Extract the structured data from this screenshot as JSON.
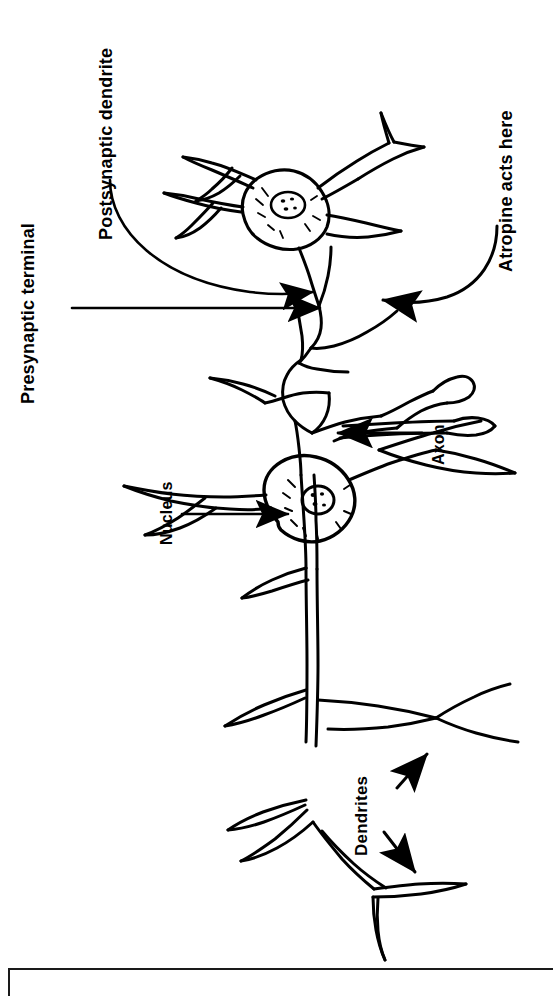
{
  "figure": {
    "orientation": "rotated-90-ccw",
    "background_color": "#ffffff",
    "ink_color": "#000000",
    "labels": {
      "presynaptic_terminal": "Presynaptic  terminal",
      "postsynaptic_dendrite": "Postsynaptic   dendrite",
      "atropine": "Atropine  acts  here",
      "axon": "Axon",
      "nucleus": "Nucleus",
      "dendrites": "Dendrites"
    },
    "caption": {
      "text": ""
    },
    "parts": [
      {
        "name": "upper-neuron-soma",
        "description": "postsynaptic cell body with nucleus and radiating dendrites"
      },
      {
        "name": "upper-neuron-nucleus",
        "description": "small circle containing dots"
      },
      {
        "name": "synaptic-cleft",
        "description": "junction between presynaptic terminal and postsynaptic dendrite"
      },
      {
        "name": "lower-neuron-soma",
        "description": "presynaptic cell body with nucleus and hatched cytoplasm"
      },
      {
        "name": "lower-neuron-nucleus",
        "description": "small circle containing dots"
      },
      {
        "name": "axon",
        "description": "long process running from lower soma toward the synapse"
      },
      {
        "name": "axon-collaterals",
        "description": "two side branches ending in terminal boutons"
      },
      {
        "name": "dendrite-tree",
        "description": "branching dendrites extending from the lower soma"
      }
    ],
    "leaders": [
      {
        "name": "presynaptic-terminal-leader",
        "type": "straight-arrow",
        "points_to": "presynaptic terminal at synapse"
      },
      {
        "name": "postsynaptic-dendrite-leader",
        "type": "curved-arrow",
        "points_to": "postsynaptic dendrite at synapse"
      },
      {
        "name": "atropine-leader",
        "type": "curved-arrow",
        "points_to": "synaptic cleft"
      },
      {
        "name": "axon-leader",
        "type": "straight-arrow",
        "points_to": "axon shaft"
      },
      {
        "name": "nucleus-leader",
        "type": "straight-arrow",
        "points_to": "nucleus of lower soma"
      },
      {
        "name": "dendrites-leader-upper",
        "type": "straight-arrow",
        "points_to": "upper dendrite branch"
      },
      {
        "name": "dendrites-leader-lower",
        "type": "straight-arrow",
        "points_to": "lower dendrite branch"
      }
    ]
  }
}
